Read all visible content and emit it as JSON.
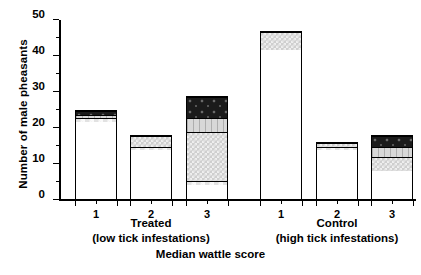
{
  "axes": {
    "ylabel": "Number of male pheasants",
    "xlabel": "Median wattle score",
    "yticks": [
      0,
      10,
      20,
      30,
      40,
      50
    ],
    "yminor": [
      5,
      15,
      25,
      35,
      45
    ],
    "ylim": [
      0,
      50
    ]
  },
  "groups": [
    {
      "name": "Treated",
      "sub": "(low tick infestations)"
    },
    {
      "name": "Control",
      "sub": "(high tick infestations)"
    }
  ],
  "xticklabels": [
    "1",
    "2",
    "3",
    "1",
    "2",
    "3"
  ],
  "legend_fills": [
    "white",
    "light-check",
    "mid-check",
    "light-gray",
    "dark-speckle"
  ],
  "chart_data": {
    "type": "bar",
    "title": "",
    "xlabel": "Median wattle score",
    "ylabel": "Number of male pheasants",
    "ylim": [
      0,
      50
    ],
    "grid": false,
    "legend": "none",
    "stacked": true,
    "categories": [
      "Treated 1",
      "Treated 2",
      "Treated 3",
      "Control 1",
      "Control 2",
      "Control 3"
    ],
    "series": [
      {
        "name": "segment-1",
        "fill": "white",
        "values": [
          22,
          14,
          4,
          42,
          14,
          8
        ]
      },
      {
        "name": "segment-2",
        "fill": "light-check",
        "values": [
          1,
          1,
          1,
          0,
          1,
          0
        ]
      },
      {
        "name": "segment-3",
        "fill": "mid-check",
        "values": [
          0,
          3,
          14,
          5,
          1,
          4
        ]
      },
      {
        "name": "segment-4",
        "fill": "light-gray",
        "values": [
          1,
          0,
          4,
          0,
          0,
          3
        ]
      },
      {
        "name": "segment-5",
        "fill": "dark-speckle",
        "values": [
          1,
          0,
          6,
          0,
          0,
          3
        ]
      }
    ],
    "totals": [
      25,
      18,
      29,
      47,
      16,
      18
    ]
  },
  "bars": [
    {
      "label": "1",
      "group": "Treated",
      "total": 25,
      "segments": [
        {
          "fill": "white",
          "value": 22
        },
        {
          "fill": "light-check",
          "value": 1
        },
        {
          "fill": "light-gray",
          "value": 1
        },
        {
          "fill": "dark-speckle",
          "value": 1
        }
      ]
    },
    {
      "label": "2",
      "group": "Treated",
      "total": 18,
      "segments": [
        {
          "fill": "white",
          "value": 14
        },
        {
          "fill": "light-check",
          "value": 1
        },
        {
          "fill": "mid-check",
          "value": 3
        }
      ]
    },
    {
      "label": "3",
      "group": "Treated",
      "total": 29,
      "segments": [
        {
          "fill": "white",
          "value": 4
        },
        {
          "fill": "light-check",
          "value": 1
        },
        {
          "fill": "mid-check",
          "value": 14
        },
        {
          "fill": "light-gray",
          "value": 4
        },
        {
          "fill": "dark-speckle",
          "value": 6
        }
      ]
    },
    {
      "label": "1",
      "group": "Control",
      "total": 47,
      "segments": [
        {
          "fill": "white",
          "value": 42
        },
        {
          "fill": "mid-check",
          "value": 5
        }
      ]
    },
    {
      "label": "2",
      "group": "Control",
      "total": 16,
      "segments": [
        {
          "fill": "white",
          "value": 14
        },
        {
          "fill": "light-check",
          "value": 1
        },
        {
          "fill": "mid-check",
          "value": 1
        }
      ]
    },
    {
      "label": "3",
      "group": "Control",
      "total": 18,
      "segments": [
        {
          "fill": "white",
          "value": 8
        },
        {
          "fill": "mid-check",
          "value": 4
        },
        {
          "fill": "light-gray",
          "value": 3
        },
        {
          "fill": "dark-speckle",
          "value": 3
        }
      ]
    }
  ]
}
